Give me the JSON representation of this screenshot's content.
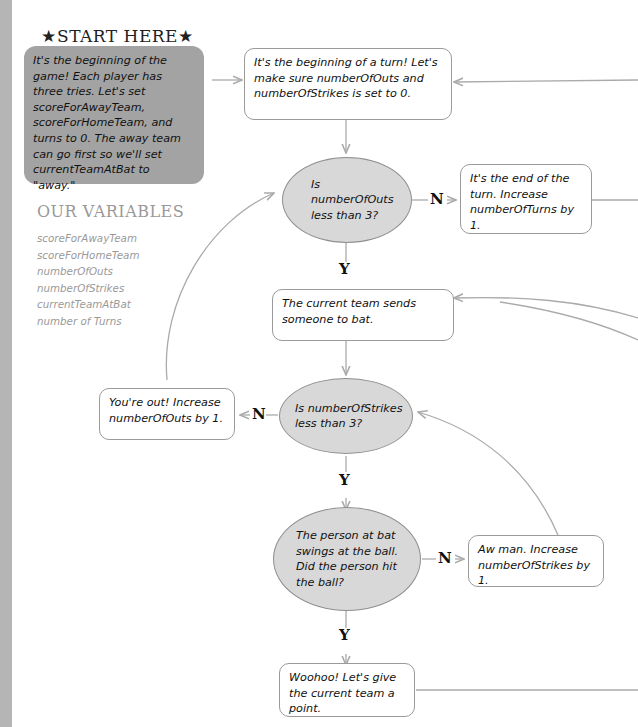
{
  "start": {
    "title": "★START HERE★",
    "text": "It's the beginning of the game! Each player has three tries. Let's set scoreForAwayTeam, scoreForHomeTeam, and turns to 0. The away team can go first so we'll set currentTeamAtBat to \"away.\""
  },
  "variables": {
    "title": "OUR VARIABLES",
    "items": [
      "scoreForAwayTeam",
      "scoreForHomeTeam",
      "numberOfOuts",
      "numberOfStrikes",
      "currentTeamAtBat",
      "number of Turns"
    ]
  },
  "nodes": {
    "begin_turn": "It's the beginning of a turn! Let's make sure numberOfOuts and numberOfStrikes is set to 0.",
    "outs_check": "Is numberOfOuts less than 3?",
    "end_turn": "It's the end of the turn. Increase numberOfTurns by 1.",
    "send_batter": "The current team sends someone to bat.",
    "strikes_check": "Is numberOfStrikes less than 3?",
    "out": "You're out! Increase numberOfOuts by 1.",
    "swing_check": "The person at bat swings at the ball. Did the person hit the ball?",
    "strike": "Aw man. Increase numberOfStrikes by 1.",
    "point": "Woohoo! Let's give the current team a point."
  },
  "labels": {
    "yes": "Y",
    "no": "N"
  },
  "colors": {
    "start_fill": "#a3a3a3",
    "decision_fill": "#d8d8d8",
    "line": "#aaaaaa",
    "muted_text": "#999999"
  }
}
